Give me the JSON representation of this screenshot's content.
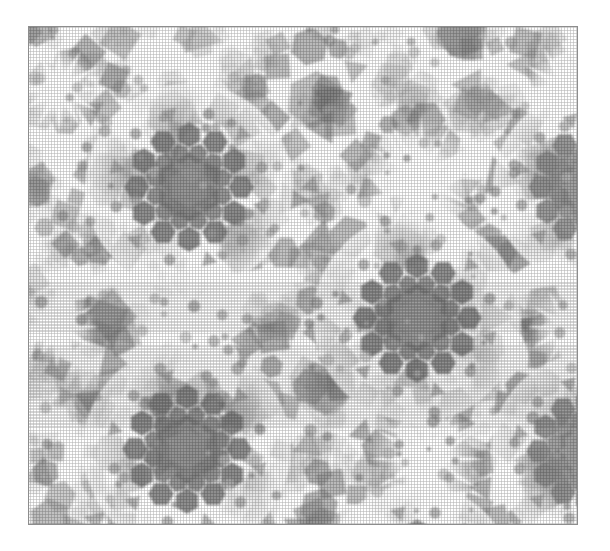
{
  "figure": {
    "canvas_width": 610,
    "canvas_height": 551
  },
  "frame": {
    "x": 28,
    "y": 26,
    "width": 550,
    "height": 499,
    "border_color": "#8d8d8d",
    "border_width": 1,
    "background": "#ffffff"
  },
  "palette": {
    "background": "#ffffff",
    "paper": "#ffffff",
    "ink_darkest": "#6f6f6f",
    "ink_dark": "#7e7e7e",
    "ink_mid": "#949494",
    "ink_light": "#b4b4b4",
    "ink_faint": "#d6d6d6",
    "highlight": "#ffffff",
    "halo": "#f2f2f2",
    "border": "#8d8d8d"
  },
  "render": {
    "halftone": true,
    "halftone_opacity": 0.3,
    "blur_px": 1.1,
    "shape_opacity": 0.62,
    "stroke_opacity": 0.35
  },
  "pattern": {
    "symmetry": "12-fold quasiperiodic",
    "lattice_period_x": 228,
    "lattice_period_y": 262,
    "shape_kinds": [
      "hexagon",
      "square",
      "rhombus",
      "triangle",
      "disc",
      "pentagon"
    ],
    "dark_rosettes": [
      {
        "cx": 160,
        "cy": 160,
        "r_core": 34,
        "r_ring": 52,
        "petals": 12,
        "tone": "ink_darkest"
      },
      {
        "cx": 388,
        "cy": 291,
        "r_core": 34,
        "r_ring": 52,
        "petals": 12,
        "tone": "ink_darkest"
      },
      {
        "cx": 158,
        "cy": 422,
        "r_core": 34,
        "r_ring": 52,
        "petals": 12,
        "tone": "ink_darkest"
      },
      {
        "cx": 560,
        "cy": 160,
        "r_core": 30,
        "r_ring": 48,
        "petals": 12,
        "tone": "ink_dark"
      },
      {
        "cx": 558,
        "cy": 424,
        "r_core": 30,
        "r_ring": 48,
        "petals": 12,
        "tone": "ink_dark"
      },
      {
        "cx": 160,
        "cy": -100,
        "r_core": 30,
        "r_ring": 48,
        "petals": 12,
        "tone": "ink_dark"
      },
      {
        "cx": 388,
        "cy": 553,
        "r_core": 30,
        "r_ring": 48,
        "petals": 12,
        "tone": "ink_dark"
      }
    ],
    "light_rosettes": [
      {
        "cx": 392,
        "cy": 150,
        "r": 58,
        "tone": "highlight"
      },
      {
        "cx": 162,
        "cy": 292,
        "r": 56,
        "tone": "highlight"
      },
      {
        "cx": 398,
        "cy": 432,
        "r": 56,
        "tone": "highlight"
      },
      {
        "cx": 538,
        "cy": 62,
        "r": 46,
        "tone": "highlight"
      },
      {
        "cx": 540,
        "cy": 300,
        "r": 40,
        "tone": "highlight"
      },
      {
        "cx": 30,
        "cy": 62,
        "r": 42,
        "tone": "highlight"
      },
      {
        "cx": 28,
        "cy": 300,
        "r": 40,
        "tone": "highlight"
      },
      {
        "cx": 172,
        "cy": 550,
        "r": 44,
        "tone": "highlight"
      }
    ],
    "cluster_centers": [
      {
        "cx": 60,
        "cy": 60
      },
      {
        "cx": 272,
        "cy": 60
      },
      {
        "cx": 484,
        "cy": 60
      },
      {
        "cx": 60,
        "cy": 196
      },
      {
        "cx": 272,
        "cy": 196
      },
      {
        "cx": 484,
        "cy": 196
      },
      {
        "cx": 60,
        "cy": 330
      },
      {
        "cx": 272,
        "cy": 330
      },
      {
        "cx": 484,
        "cy": 330
      },
      {
        "cx": 60,
        "cy": 464
      },
      {
        "cx": 272,
        "cy": 464
      },
      {
        "cx": 484,
        "cy": 464
      },
      {
        "cx": 166,
        "cy": 128
      },
      {
        "cx": 378,
        "cy": 128
      },
      {
        "cx": 166,
        "cy": 394
      },
      {
        "cx": 378,
        "cy": 394
      }
    ],
    "shape_counts": {
      "hexagons": 620,
      "squares": 360,
      "triangles": 300,
      "discs": 420
    },
    "seed": 20240613
  }
}
